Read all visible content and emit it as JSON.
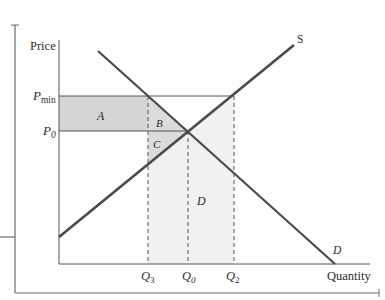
{
  "diagram": {
    "type": "supply-demand price floor",
    "axis": {
      "y_label": "Price",
      "x_label": "Quantity"
    },
    "price_labels": {
      "pmin_base": "P",
      "pmin_sub": "min",
      "p0_base": "P",
      "p0_sub": "0"
    },
    "quantity_labels": {
      "q3_base": "Q",
      "q3_sub": "3",
      "q0_base": "Q",
      "q0_sub": "0",
      "q2_base": "Q",
      "q2_sub": "2"
    },
    "curves": {
      "supply_label": "S",
      "demand_label": "D"
    },
    "regions": {
      "a": "A",
      "b": "B",
      "c": "C",
      "d": "D"
    },
    "colors": {
      "line": "#555555",
      "curve": "#4a4a4a",
      "region_a": "#d5d5d5",
      "region_bc": "#dcdcdc",
      "region_d": "#f1f1f1",
      "text": "#2b2b2b"
    }
  }
}
